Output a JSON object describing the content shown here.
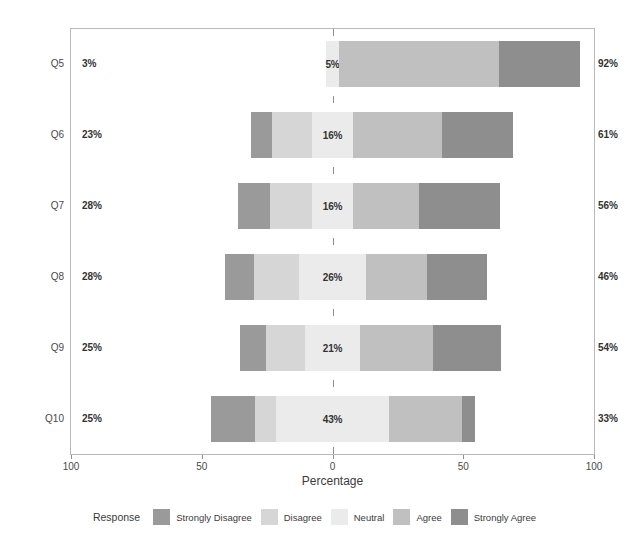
{
  "chart_data": {
    "type": "bar",
    "subtype": "diverging-stacked-likert",
    "title": "",
    "xlabel": "Percentage",
    "ylabel": "",
    "categories": [
      "Q5",
      "Q6",
      "Q7",
      "Q8",
      "Q9",
      "Q10"
    ],
    "legend_title": "Response",
    "legend_position": "bottom",
    "grid": false,
    "xlim": [
      -100,
      100
    ],
    "xticks": [
      -100,
      -50,
      0,
      50,
      100
    ],
    "xtick_labels": [
      "100",
      "50",
      "0",
      "50",
      "100"
    ],
    "series": [
      {
        "name": "Strongly Disagree",
        "color": "#9a9a9a",
        "values": [
          0,
          8,
          12,
          11,
          10,
          17
        ]
      },
      {
        "name": "Disagree",
        "color": "#d6d6d6",
        "values": [
          3,
          15,
          16,
          17,
          15,
          8
        ]
      },
      {
        "name": "Neutral",
        "color": "#ebebeb",
        "values": [
          5,
          16,
          16,
          26,
          21,
          43
        ]
      },
      {
        "name": "Agree",
        "color": "#c0c0c0",
        "values": [
          61,
          34,
          25,
          23,
          28,
          28
        ]
      },
      {
        "name": "Strongly Agree",
        "color": "#8e8e8e",
        "values": [
          31,
          27,
          31,
          23,
          26,
          5
        ]
      }
    ],
    "left_totals": [
      "3%",
      "23%",
      "28%",
      "28%",
      "25%",
      "25%"
    ],
    "right_totals": [
      "92%",
      "61%",
      "56%",
      "46%",
      "54%",
      "33%"
    ],
    "neutral_labels": [
      "5%",
      "16%",
      "16%",
      "26%",
      "21%",
      "43%"
    ],
    "bar_layout": [
      {
        "category": "Q5",
        "start": -2.5,
        "segments": [
          {
            "series": "Strongly Disagree",
            "width": 0
          },
          {
            "series": "Disagree",
            "width": 0
          },
          {
            "series": "Neutral",
            "width": 5
          },
          {
            "series": "Agree",
            "width": 61
          },
          {
            "series": "Strongly Agree",
            "width": 31
          }
        ]
      },
      {
        "category": "Q6",
        "start": -31.0,
        "segments": [
          {
            "series": "Strongly Disagree",
            "width": 8
          },
          {
            "series": "Disagree",
            "width": 15
          },
          {
            "series": "Neutral",
            "width": 16
          },
          {
            "series": "Agree",
            "width": 34
          },
          {
            "series": "Strongly Agree",
            "width": 27
          }
        ]
      },
      {
        "category": "Q7",
        "start": -36.0,
        "segments": [
          {
            "series": "Strongly Disagree",
            "width": 12
          },
          {
            "series": "Disagree",
            "width": 16
          },
          {
            "series": "Neutral",
            "width": 16
          },
          {
            "series": "Agree",
            "width": 25
          },
          {
            "series": "Strongly Agree",
            "width": 31
          }
        ]
      },
      {
        "category": "Q8",
        "start": -41.0,
        "segments": [
          {
            "series": "Strongly Disagree",
            "width": 11
          },
          {
            "series": "Disagree",
            "width": 17
          },
          {
            "series": "Neutral",
            "width": 26
          },
          {
            "series": "Agree",
            "width": 23
          },
          {
            "series": "Strongly Agree",
            "width": 23
          }
        ]
      },
      {
        "category": "Q9",
        "start": -35.5,
        "segments": [
          {
            "series": "Strongly Disagree",
            "width": 10
          },
          {
            "series": "Disagree",
            "width": 15
          },
          {
            "series": "Neutral",
            "width": 21
          },
          {
            "series": "Agree",
            "width": 28
          },
          {
            "series": "Strongly Agree",
            "width": 26
          }
        ]
      },
      {
        "category": "Q10",
        "start": -46.5,
        "segments": [
          {
            "series": "Strongly Disagree",
            "width": 17
          },
          {
            "series": "Disagree",
            "width": 8
          },
          {
            "series": "Neutral",
            "width": 43
          },
          {
            "series": "Agree",
            "width": 28
          },
          {
            "series": "Strongly Agree",
            "width": 5
          }
        ]
      }
    ]
  },
  "axis": {
    "x_title": "Percentage"
  },
  "legend": {
    "title": "Response",
    "items": [
      {
        "label": "Strongly Disagree",
        "color": "#9a9a9a"
      },
      {
        "label": "Disagree",
        "color": "#d6d6d6"
      },
      {
        "label": "Neutral",
        "color": "#ebebeb"
      },
      {
        "label": "Agree",
        "color": "#c0c0c0"
      },
      {
        "label": "Strongly Agree",
        "color": "#8e8e8e"
      }
    ]
  }
}
